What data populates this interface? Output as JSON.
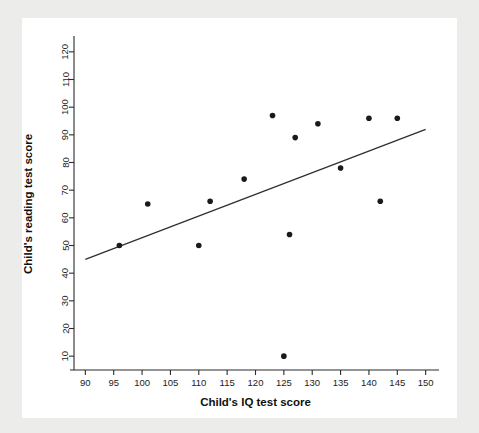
{
  "chart_data": {
    "type": "scatter",
    "title": "",
    "xlabel": "Child's IQ test score",
    "ylabel": "Child's reading test score",
    "xlim": [
      88,
      152
    ],
    "ylim": [
      5,
      125
    ],
    "xticks": [
      90,
      95,
      100,
      105,
      110,
      115,
      120,
      125,
      130,
      135,
      140,
      145,
      150
    ],
    "yticks": [
      10,
      20,
      30,
      40,
      50,
      60,
      70,
      80,
      90,
      100,
      110,
      120
    ],
    "grid": false,
    "legend": null,
    "point_color": "#1a1a1a",
    "line_color": "#2f2f2f",
    "points": [
      {
        "x": 96,
        "y": 50
      },
      {
        "x": 101,
        "y": 65
      },
      {
        "x": 110,
        "y": 50
      },
      {
        "x": 112,
        "y": 66
      },
      {
        "x": 118,
        "y": 74
      },
      {
        "x": 123,
        "y": 97
      },
      {
        "x": 125,
        "y": 10
      },
      {
        "x": 126,
        "y": 54
      },
      {
        "x": 127,
        "y": 89
      },
      {
        "x": 131,
        "y": 94
      },
      {
        "x": 135,
        "y": 78
      },
      {
        "x": 140,
        "y": 96
      },
      {
        "x": 142,
        "y": 66
      },
      {
        "x": 145,
        "y": 96
      }
    ],
    "fit_line": {
      "x_start": 90,
      "y_start": 45,
      "x_end": 150,
      "y_end": 92
    }
  }
}
